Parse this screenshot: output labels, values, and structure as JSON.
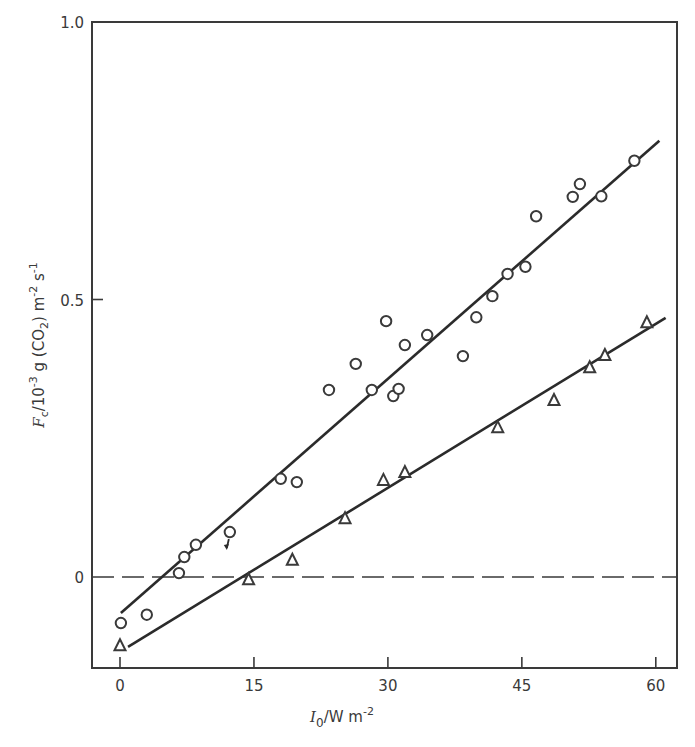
{
  "chart_data": {
    "type": "scatter",
    "title": "",
    "xlabel": "I_0 / W m^-2",
    "ylabel": "F_c / 10^-3 g (CO2) m^-2 s^-1",
    "xlabel_parts": {
      "symbol": "I",
      "sub": "0",
      "rest": "/W m",
      "sup": "-2"
    },
    "ylabel_parts": {
      "symbol": "F",
      "sub": "c",
      "p1": "/10",
      "sup1": "-3",
      "p2": " g (CO",
      "sub2": "2",
      "p3": ") m",
      "sup2": "-2",
      "p4": " s",
      "sup3": "-1"
    },
    "xlim": [
      -3.2,
      62.5
    ],
    "ylim": [
      -0.165,
      1.0
    ],
    "xticks": [
      0,
      15,
      30,
      45,
      60
    ],
    "xtick_labels": [
      "0",
      "15",
      "30",
      "45",
      "60"
    ],
    "yticks": [
      0,
      0.5,
      1.0
    ],
    "ytick_labels": [
      "0",
      "0.5",
      "1.0"
    ],
    "grid": false,
    "legend": null,
    "reference_line": {
      "y": 0,
      "style": "dashed"
    },
    "series": [
      {
        "name": "circles",
        "marker": "circle",
        "points": [
          [
            0.1,
            -0.083
          ],
          [
            3.0,
            -0.068
          ],
          [
            6.6,
            0.007
          ],
          [
            7.2,
            0.036
          ],
          [
            8.5,
            0.058
          ],
          [
            12.3,
            0.081
          ],
          [
            18.0,
            0.177
          ],
          [
            19.8,
            0.171
          ],
          [
            23.4,
            0.337
          ],
          [
            26.4,
            0.384
          ],
          [
            28.2,
            0.337
          ],
          [
            29.8,
            0.461
          ],
          [
            30.6,
            0.326
          ],
          [
            31.2,
            0.339
          ],
          [
            31.9,
            0.418
          ],
          [
            34.4,
            0.436
          ],
          [
            38.4,
            0.398
          ],
          [
            39.9,
            0.468
          ],
          [
            41.7,
            0.506
          ],
          [
            43.4,
            0.546
          ],
          [
            45.4,
            0.559
          ],
          [
            46.6,
            0.65
          ],
          [
            50.7,
            0.685
          ],
          [
            51.5,
            0.708
          ],
          [
            53.9,
            0.686
          ],
          [
            57.6,
            0.75
          ]
        ],
        "fit_line": [
          [
            0.1,
            -0.065
          ],
          [
            60.4,
            0.786
          ]
        ]
      },
      {
        "name": "triangles",
        "marker": "triangle",
        "points": [
          [
            0.0,
            -0.123
          ],
          [
            14.4,
            -0.004
          ],
          [
            19.3,
            0.031
          ],
          [
            25.2,
            0.106
          ],
          [
            29.5,
            0.175
          ],
          [
            31.9,
            0.189
          ],
          [
            42.3,
            0.27
          ],
          [
            48.6,
            0.319
          ],
          [
            52.6,
            0.378
          ],
          [
            54.3,
            0.4
          ],
          [
            59.0,
            0.459
          ]
        ],
        "fit_line": [
          [
            0.9,
            -0.126
          ],
          [
            61.1,
            0.467
          ]
        ]
      }
    ],
    "annotations": [
      {
        "type": "arrow",
        "near": [
          12.3,
          0.081
        ],
        "note": "small arrow below point"
      }
    ]
  },
  "layout": {
    "plot_px": {
      "left": 92,
      "top": 22,
      "right": 677,
      "bottom": 668
    },
    "x_px": {
      "v0": 120,
      "scale": 8.93
    },
    "y_px": {
      "v0": 577,
      "scale": 555
    }
  }
}
